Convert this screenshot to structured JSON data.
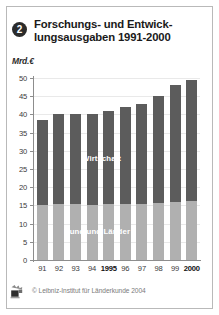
{
  "header": {
    "badge_number": "2",
    "title_line1": "Forschungs- und Entwick-",
    "title_line2": "lungsausgaben 1991-2000"
  },
  "footer": {
    "copyright": "© Leibniz-Institut für Länderkunde 2004",
    "logo_icon": "leibniz-ifl-logo-icon"
  },
  "colors": {
    "wirtschaft": "#5c5c5c",
    "bund_und_laender": "#b0b0b0",
    "axis": "#8d8d8d",
    "grid": "#e9e9e9",
    "frame": "#b9b9b9",
    "badge": "#2b2b2b"
  },
  "chart_data": {
    "type": "bar",
    "stacked": true,
    "ylabel": "Mrd.€",
    "xlabel": "",
    "ylim": [
      0,
      50
    ],
    "yticks": [
      0,
      5,
      10,
      15,
      20,
      25,
      30,
      35,
      40,
      45,
      50
    ],
    "ytick_labels": [
      "0",
      "5",
      "10",
      "15",
      "20",
      "25",
      "30",
      "35",
      "40",
      "45",
      "50"
    ],
    "grid": true,
    "legend": "inline-labels",
    "categories": [
      "91",
      "92",
      "93",
      "94",
      "1995",
      "96",
      "97",
      "98",
      "99",
      "2000"
    ],
    "categories_bold": [
      "1995",
      "2000"
    ],
    "series": [
      {
        "name": "Bund und Länder",
        "color": "#b0b0b0",
        "values": [
          15.2,
          15.3,
          15.4,
          15.2,
          15.5,
          15.3,
          15.4,
          15.6,
          16.0,
          16.2
        ]
      },
      {
        "name": "Wirtschaft",
        "color": "#5c5c5c",
        "values": [
          23.3,
          24.7,
          24.6,
          24.8,
          25.5,
          26.7,
          27.6,
          29.4,
          32.0,
          33.3
        ]
      }
    ],
    "totals": [
      38.5,
      40.0,
      40.0,
      40.0,
      41.0,
      42.0,
      43.0,
      45.0,
      48.0,
      49.5
    ]
  }
}
